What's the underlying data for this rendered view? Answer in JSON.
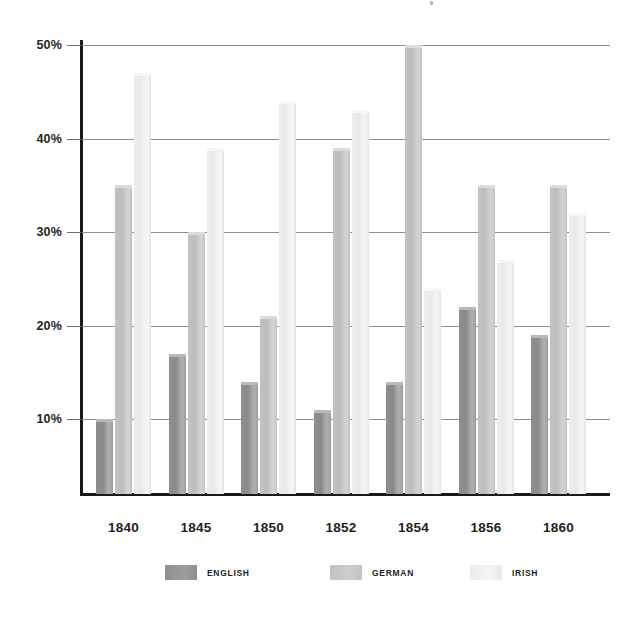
{
  "chart_data": {
    "type": "bar",
    "title": "",
    "subtitle": "",
    "xlabel": "",
    "ylabel": "",
    "categories": [
      "1840",
      "1845",
      "1850",
      "1852",
      "1854",
      "1856",
      "1860"
    ],
    "series": [
      {
        "name": "ENGLISH",
        "color": "#8f8f8f",
        "values": [
          10,
          17,
          14,
          11,
          14,
          22,
          19
        ]
      },
      {
        "name": "GERMAN",
        "color": "#c2c2c2",
        "values": [
          35,
          30,
          21,
          39,
          50,
          35,
          35
        ]
      },
      {
        "name": "IRISH",
        "color": "#ededed",
        "values": [
          47,
          39,
          44,
          43,
          24,
          27,
          32
        ]
      }
    ],
    "ylim": [
      0,
      50
    ],
    "y_ticks": [
      10,
      20,
      30,
      40,
      50
    ],
    "y_tick_labels": [
      "10%",
      "20%",
      "30%",
      "40%",
      "50%"
    ],
    "grid": true,
    "legend_position": "bottom",
    "value_unit": "percent"
  },
  "legend": {
    "items": [
      {
        "label": "ENGLISH"
      },
      {
        "label": "GERMAN"
      },
      {
        "label": "IRISH"
      }
    ]
  }
}
